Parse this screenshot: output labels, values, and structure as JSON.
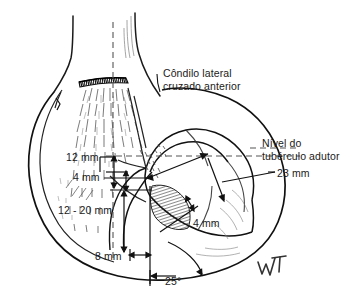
{
  "figure": {
    "background_color": "#ffffff",
    "ink_color": "#1a1a1a",
    "signature": "WT"
  },
  "labels": {
    "condyle_line1": "Côndilo lateral",
    "condyle_line2": "cruzado anterior",
    "level_line1": "Nível do",
    "level_line2": "tubérculo adutor",
    "measure_12mm": "12 mm",
    "measure_4mm_left": "4 mm",
    "measure_23mm": "23 mm",
    "measure_12_20mm": "12 - 20 mm",
    "measure_4mm_right": "4 mm",
    "measure_8mm": "8 mm",
    "measure_25deg": "25°"
  },
  "measurements": [
    {
      "name": "proximal-offset",
      "value": "12 mm"
    },
    {
      "name": "secondary-offset",
      "value": "4 mm"
    },
    {
      "name": "condyle-width",
      "value": "23 mm"
    },
    {
      "name": "range-depth",
      "value": "12 - 20 mm"
    },
    {
      "name": "notch-offset",
      "value": "4 mm"
    },
    {
      "name": "tunnel-offset",
      "value": "8 mm"
    },
    {
      "name": "tunnel-angle",
      "value": "25°"
    }
  ]
}
